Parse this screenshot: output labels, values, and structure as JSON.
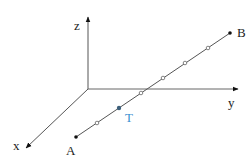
{
  "diagram": {
    "type": "3d-coordinate-axes-with-line-segment",
    "axes": {
      "x": {
        "label": "x"
      },
      "y": {
        "label": "y"
      },
      "z": {
        "label": "z"
      }
    },
    "points": {
      "A": {
        "label": "A"
      },
      "B": {
        "label": "B"
      },
      "T": {
        "label": "T",
        "color": "#3a8fd0"
      }
    },
    "segment": {
      "from": "A",
      "to": "B",
      "division_marks": 5
    },
    "colors": {
      "axis": "#555555",
      "segment": "#555555",
      "point": "#111111",
      "highlight": "#3a8fd0"
    }
  }
}
